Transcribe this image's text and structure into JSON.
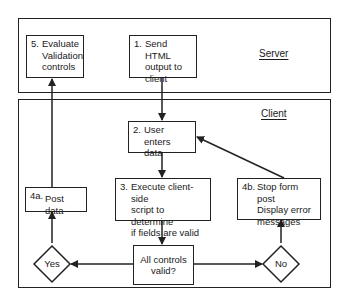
{
  "regions": {
    "server": {
      "label": "Server"
    },
    "client": {
      "label": "Client"
    }
  },
  "steps": {
    "step5": {
      "number": "5.",
      "text": "Evaluate\nValidation\ncontrols"
    },
    "step1": {
      "number": "1.",
      "text": "Send HTML\noutput to\nclient"
    },
    "step2": {
      "number": "2.",
      "text": "User enters\ndata"
    },
    "step3": {
      "number": "3.",
      "text": "Execute client-side\nscript to determine\nif fields are valid"
    },
    "step4a": {
      "number": "4a.",
      "text": "Post data"
    },
    "step4b": {
      "number": "4b.",
      "text": "Stop form post\nDisplay error\nmessages"
    },
    "decision": {
      "text": "All controls\nvalid?"
    }
  },
  "decisions": {
    "yes": {
      "label": "Yes"
    },
    "no": {
      "label": "No"
    }
  },
  "colors": {
    "stroke": "#222222",
    "background": "#ffffff"
  }
}
